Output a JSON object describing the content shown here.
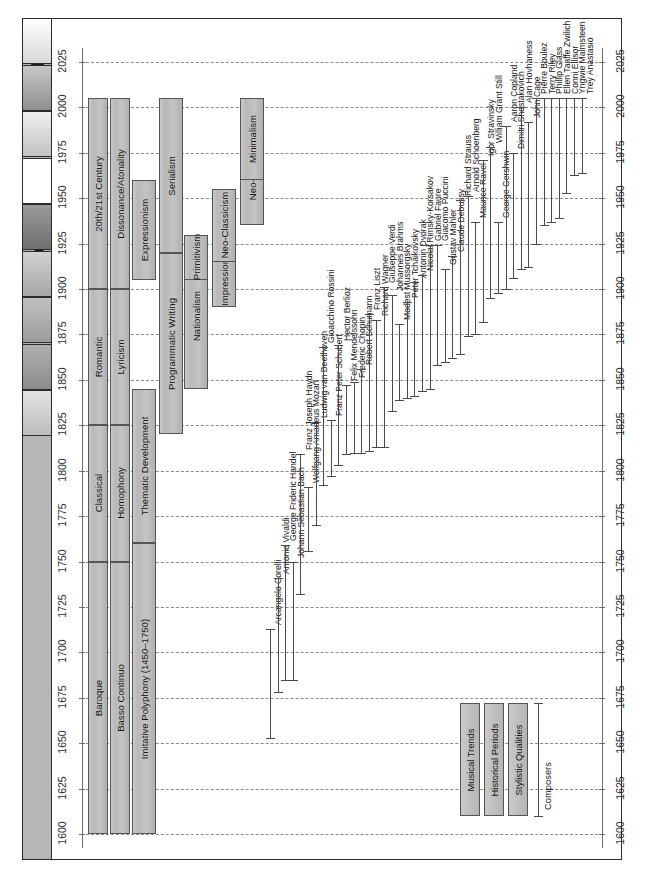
{
  "title": "Music for the Concert Hall",
  "title_icon": "music-note-icon",
  "colors": {
    "bar_fill": "#bfbfbf",
    "bar_stroke": "#555555",
    "title_bar": "#b6b6b6",
    "grid": "#8a8a8a",
    "text": "#141414"
  },
  "axis": {
    "label": "Year",
    "min": 1600,
    "max": 2025,
    "step": 25,
    "ticks": [
      1600,
      1625,
      1650,
      1675,
      1700,
      1725,
      1750,
      1775,
      1800,
      1825,
      1850,
      1875,
      1900,
      1925,
      1950,
      1975,
      2000,
      2025
    ]
  },
  "legend": {
    "items": [
      {
        "label": "Musical Trends",
        "kind": "bar"
      },
      {
        "label": "Historical Periods",
        "kind": "bar"
      },
      {
        "label": "Stylistic Qualities",
        "kind": "bar"
      },
      {
        "label": "Composers",
        "kind": "span"
      }
    ]
  },
  "tiles": [
    {
      "name": "tile-1"
    },
    {
      "name": "tile-2"
    },
    {
      "name": "tile-3"
    },
    {
      "name": "tile-4"
    },
    {
      "name": "tile-5"
    },
    {
      "name": "tile-6"
    },
    {
      "name": "tile-7"
    },
    {
      "name": "tile-8"
    },
    {
      "name": "tile-9"
    }
  ],
  "chart_data": {
    "type": "timeline",
    "title": "Music for the Concert Hall",
    "xlabel": "",
    "ylabel": "Year",
    "ylim": [
      1600,
      2025
    ],
    "grid": true,
    "legend_position": "bottom-left",
    "series": [
      {
        "name": "Historical Periods",
        "track": 0,
        "items": [
          {
            "label": "Baroque",
            "start": 1600,
            "end": 1750
          },
          {
            "label": "Classical",
            "start": 1750,
            "end": 1825
          },
          {
            "label": "Romantic",
            "start": 1825,
            "end": 1900
          },
          {
            "label": "20th/21st Century",
            "start": 1900,
            "end": 2005
          }
        ]
      },
      {
        "name": "Stylistic Qualities",
        "track": 1,
        "items": [
          {
            "label": "Basso Continuo",
            "start": 1600,
            "end": 1750
          },
          {
            "label": "Homophony",
            "start": 1750,
            "end": 1825
          },
          {
            "label": "Lyricism",
            "start": 1825,
            "end": 1900
          },
          {
            "label": "Dissonance/Atonality",
            "start": 1900,
            "end": 2005
          }
        ]
      },
      {
        "name": "Musical Trends",
        "track": 2,
        "items": [
          {
            "label": "Imitative Polyphony (1450–1750)",
            "start": 1600,
            "end": 1760
          },
          {
            "label": "Thematic Development",
            "start": 1760,
            "end": 1845
          },
          {
            "label": "Expressionism",
            "start": 1905,
            "end": 1960
          }
        ]
      },
      {
        "name": "Musical Trends 2",
        "track": 3,
        "items": [
          {
            "label": "Programmatic Writing",
            "start": 1820,
            "end": 1920
          },
          {
            "label": "Serialism",
            "start": 1920,
            "end": 2005
          }
        ]
      },
      {
        "name": "Musical Trends 3",
        "track": 4,
        "items": [
          {
            "label": "Nationalism",
            "start": 1845,
            "end": 1925
          },
          {
            "label": "Primitivism",
            "start": 1905,
            "end": 1930
          }
        ]
      },
      {
        "name": "Musical Trends 4",
        "track": 5,
        "items": [
          {
            "label": "Impressionism",
            "start": 1890,
            "end": 1925
          },
          {
            "label": "Neo-Classicism",
            "start": 1915,
            "end": 1955
          }
        ]
      },
      {
        "name": "Musical Trends 5",
        "track": 6,
        "items": [
          {
            "label": "Neo-Romanticism",
            "start": 1935,
            "end": 2005
          },
          {
            "label": "Minimalism",
            "start": 1960,
            "end": 2005
          }
        ]
      }
    ],
    "composers": [
      {
        "name": "Arcangelo Corelli",
        "birth": 1653,
        "death": 1713
      },
      {
        "name": "Antonio Vivaldi",
        "birth": 1678,
        "death": 1741
      },
      {
        "name": "George Frideric Handel",
        "birth": 1685,
        "death": 1759
      },
      {
        "name": "Johann Sebastian Bach",
        "birth": 1685,
        "death": 1750
      },
      {
        "name": "Franz Joseph Haydn",
        "birth": 1732,
        "death": 1809
      },
      {
        "name": "Wolfgang Amadeus Mozart",
        "birth": 1756,
        "death": 1791
      },
      {
        "name": "Ludwig van Beethoven",
        "birth": 1770,
        "death": 1827
      },
      {
        "name": "Gioacchino Rossini",
        "birth": 1792,
        "death": 1868
      },
      {
        "name": "Franz Peter Schubert",
        "birth": 1797,
        "death": 1828
      },
      {
        "name": "Hector Berlioz",
        "birth": 1803,
        "death": 1869
      },
      {
        "name": "Felix Mendelssohn",
        "birth": 1809,
        "death": 1847
      },
      {
        "name": "Frederic Chopin",
        "birth": 1810,
        "death": 1849
      },
      {
        "name": "Robert Schumann",
        "birth": 1810,
        "death": 1856
      },
      {
        "name": "Franz Liszt",
        "birth": 1811,
        "death": 1886
      },
      {
        "name": "Richard Wagner",
        "birth": 1813,
        "death": 1883
      },
      {
        "name": "Giuseppe Verdi",
        "birth": 1813,
        "death": 1901
      },
      {
        "name": "Johannes Brahms",
        "birth": 1833,
        "death": 1897
      },
      {
        "name": "Modest Mussorgsky",
        "birth": 1839,
        "death": 1881
      },
      {
        "name": "Peter Tchaikovsky",
        "birth": 1840,
        "death": 1893
      },
      {
        "name": "Antonin Dvorak",
        "birth": 1841,
        "death": 1904
      },
      {
        "name": "Nicolai Rimsky-Korsakov",
        "birth": 1844,
        "death": 1908
      },
      {
        "name": "Gabriel Faure",
        "birth": 1845,
        "death": 1924
      },
      {
        "name": "Giacomo Puccini",
        "birth": 1858,
        "death": 1924
      },
      {
        "name": "Gustav Mahler",
        "birth": 1860,
        "death": 1911
      },
      {
        "name": "Claude Debussy",
        "birth": 1862,
        "death": 1918
      },
      {
        "name": "Richard Strauss",
        "birth": 1864,
        "death": 1949
      },
      {
        "name": "Arnold Schoenberg",
        "birth": 1874,
        "death": 1951
      },
      {
        "name": "Maurice Ravel",
        "birth": 1875,
        "death": 1937
      },
      {
        "name": "Igor Stravinsky",
        "birth": 1882,
        "death": 1971
      },
      {
        "name": "William Grant Still",
        "birth": 1895,
        "death": 1978
      },
      {
        "name": "George Gershwin",
        "birth": 1898,
        "death": 1937
      },
      {
        "name": "Aaron Copland",
        "birth": 1900,
        "death": 1990
      },
      {
        "name": "Dimitri Shostakovich",
        "birth": 1906,
        "death": 1975
      },
      {
        "name": "Alan Hovhaness",
        "birth": 1911,
        "death": 2000
      },
      {
        "name": "John Cage",
        "birth": 1912,
        "death": 1992
      },
      {
        "name": "Pierre Boulez",
        "birth": 1925,
        "death": 2005
      },
      {
        "name": "Terry Riley",
        "birth": 1935,
        "death": 2005
      },
      {
        "name": "Phillip Glass",
        "birth": 1937,
        "death": 2005
      },
      {
        "name": "Ellen Taaffe Zwilich",
        "birth": 1939,
        "death": 2005
      },
      {
        "name": "Conni Ellisor",
        "birth": 1953,
        "death": 2005
      },
      {
        "name": "Yngwie Malmsteen",
        "birth": 1963,
        "death": 2005
      },
      {
        "name": "Trey Anastasio",
        "birth": 1964,
        "death": 2005
      }
    ]
  }
}
